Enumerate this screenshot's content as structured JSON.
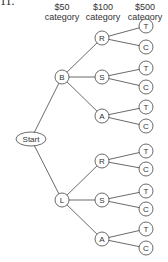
{
  "question_number": "11.",
  "headers": [
    {
      "line1": "$50",
      "line2": "category"
    },
    {
      "line1": "$100",
      "line2": "category"
    },
    {
      "line1": "$500",
      "line2": "category"
    }
  ],
  "tree": {
    "root": "Start",
    "level1": [
      "B",
      "L"
    ],
    "level2": [
      "R",
      "S",
      "A"
    ],
    "level3": [
      "T",
      "C"
    ]
  },
  "nodes": {
    "start": "Start",
    "b": "B",
    "l": "L",
    "r": "R",
    "s": "S",
    "a": "A",
    "t": "T",
    "c": "C"
  },
  "colors": {
    "line": "#444444",
    "node_fill": "#ffffff"
  }
}
